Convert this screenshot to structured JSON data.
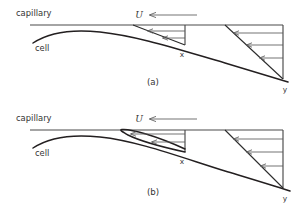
{
  "figure": {
    "background_color": "#ffffff",
    "line_color": "#231f20",
    "thin_line_color": "#5a5a5a",
    "text_color": "#333333",
    "width": 306,
    "height": 215
  },
  "panels": [
    {
      "id": "a",
      "caption": "(a)",
      "labels": {
        "capillary": "capillary",
        "cell": "cell",
        "velocity": "U",
        "station_x": "x",
        "station_y": "y"
      },
      "description": "Attached boundary layer: velocity profile at station x is skewed but unidirectional; profile at station y is linear shear.",
      "profile_x_type": "skewed-forward",
      "profile_y_type": "linear-shear",
      "separation": false,
      "arrow_count_x": 2,
      "arrow_count_y": 3
    },
    {
      "id": "b",
      "caption": "(b)",
      "labels": {
        "capillary": "capillary",
        "cell": "cell",
        "velocity": "U",
        "station_x": "x",
        "station_y": "y"
      },
      "description": "Separated flow: reversed-flow recirculation bubble near the cell at station x; profile at station y is linear shear.",
      "profile_x_type": "reversed-flow",
      "profile_y_type": "linear-shear",
      "separation": true,
      "arrow_count_x": 2,
      "arrow_count_y": 3
    }
  ],
  "annotations": {
    "flow_direction": "leftward",
    "freestream_symbol": "U"
  }
}
